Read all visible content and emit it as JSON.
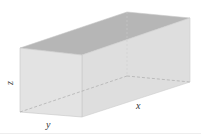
{
  "diagram": {
    "type": "rectangular-prism",
    "labels": {
      "x": "x",
      "y": "y",
      "z": "z"
    },
    "colors": {
      "top_face": "#b4b4b4",
      "front_face": "#e4e4e4",
      "side_face": "#dedede",
      "edge": "#c4c4c4",
      "hidden_edge": "#a8a8a8"
    }
  }
}
